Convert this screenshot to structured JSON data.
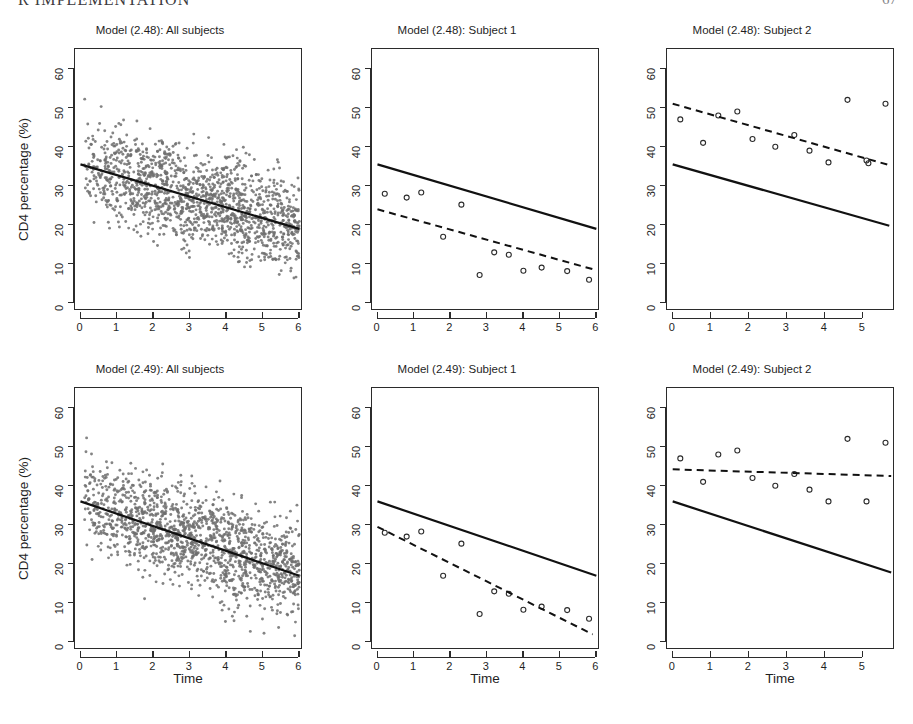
{
  "header": {
    "running_title": "R IMPLEMENTATION",
    "page_number": "67"
  },
  "figure": {
    "axis": {
      "xlabel": "Time",
      "ylabel": "CD4 percentage (%)",
      "yticks": [
        0,
        10,
        20,
        30,
        40,
        50,
        60
      ],
      "xticks_full": [
        0,
        1,
        2,
        3,
        4,
        5,
        6
      ],
      "xticks_short": [
        0,
        1,
        2,
        3,
        4,
        5
      ]
    },
    "panels": [
      {
        "id": "p248-all",
        "title": "Model (2.48): All subjects",
        "row": 0,
        "col": 0,
        "show_ylab": true,
        "show_xlab": false
      },
      {
        "id": "p248-s1",
        "title": "Model (2.48): Subject 1",
        "row": 0,
        "col": 1,
        "show_ylab": false,
        "show_xlab": false
      },
      {
        "id": "p248-s2",
        "title": "Model (2.48): Subject 2",
        "row": 0,
        "col": 2,
        "show_ylab": false,
        "show_xlab": false
      },
      {
        "id": "p249-all",
        "title": "Model (2.49): All subjects",
        "row": 1,
        "col": 0,
        "show_ylab": true,
        "show_xlab": true
      },
      {
        "id": "p249-s1",
        "title": "Model (2.49): Subject 1",
        "row": 1,
        "col": 1,
        "show_ylab": false,
        "show_xlab": true
      },
      {
        "id": "p249-s2",
        "title": "Model (2.49): Subject 2",
        "row": 1,
        "col": 2,
        "show_ylab": false,
        "show_xlab": true
      }
    ]
  },
  "colors": {
    "scatter_point": "#6e6e6e",
    "line": "#111111",
    "axis": "#2b2b2b",
    "background": "#ffffff"
  },
  "chart_data": [
    {
      "id": "p248-all",
      "type": "scatter",
      "title": "Model (2.48): All subjects",
      "xlabel": "Time",
      "ylabel": "CD4 percentage (%)",
      "xlim": [
        -0.15,
        6.1
      ],
      "ylim": [
        -2.0,
        65.0
      ],
      "xticks": [
        0,
        1,
        2,
        3,
        4,
        5,
        6
      ],
      "yticks": [
        0,
        10,
        20,
        30,
        40,
        50,
        60
      ],
      "grid": false,
      "legend": null,
      "series": [
        {
          "name": "CD4 observations (all subjects)",
          "style": "points",
          "marker": "filled-small-circle",
          "color": "#6e6e6e",
          "n_points": 1600,
          "note": "Dense cloud of all repeated CD4 percentage measurements; generated from the described density envelope."
        },
        {
          "name": "Population-average fit",
          "style": "solid-line",
          "color": "#111111",
          "intercept": 35.5,
          "slope": -2.75,
          "x_range": [
            0,
            6
          ],
          "y_endpoints": [
            35.5,
            19.0
          ]
        }
      ]
    },
    {
      "id": "p248-s1",
      "type": "scatter",
      "title": "Model (2.48): Subject 1",
      "xlabel": "Time",
      "ylabel": "CD4 percentage (%)",
      "xlim": [
        -0.15,
        6.1
      ],
      "ylim": [
        -2.0,
        65.0
      ],
      "xticks": [
        0,
        1,
        2,
        3,
        4,
        5,
        6
      ],
      "yticks": [
        0,
        10,
        20,
        30,
        40,
        50,
        60
      ],
      "grid": false,
      "legend": null,
      "series": [
        {
          "name": "Subject 1 observations",
          "style": "points",
          "marker": "open-circle",
          "color": "#2b2b2b",
          "x": [
            0.2,
            0.8,
            1.2,
            2.3,
            1.8,
            2.8,
            3.2,
            3.6,
            4.0,
            4.5,
            5.2,
            5.8
          ],
          "y": [
            28.0,
            27.0,
            28.3,
            25.2,
            17.0,
            7.2,
            13.0,
            12.4,
            8.3,
            9.1,
            8.2,
            6.0
          ]
        },
        {
          "name": "Population-average fit",
          "style": "solid-line",
          "color": "#111111",
          "intercept": 35.5,
          "slope": -2.75,
          "x_range": [
            0,
            6
          ],
          "y_endpoints": [
            35.5,
            19.0
          ]
        },
        {
          "name": "Subject-specific fit",
          "style": "dashed-line",
          "color": "#111111",
          "intercept": 24.0,
          "slope": -2.6,
          "x_range": [
            0,
            5.9
          ],
          "y_endpoints": [
            24.0,
            8.7
          ]
        }
      ]
    },
    {
      "id": "p248-s2",
      "type": "scatter",
      "title": "Model (2.48): Subject 2",
      "xlabel": "Time",
      "ylabel": "CD4 percentage (%)",
      "xlim": [
        -0.15,
        5.85
      ],
      "ylim": [
        -2.0,
        65.0
      ],
      "xticks": [
        0,
        1,
        2,
        3,
        4,
        5
      ],
      "yticks": [
        0,
        10,
        20,
        30,
        40,
        50,
        60
      ],
      "grid": false,
      "legend": null,
      "series": [
        {
          "name": "Subject 2 observations",
          "style": "points",
          "marker": "open-circle",
          "color": "#2b2b2b",
          "x": [
            0.2,
            0.8,
            1.2,
            1.7,
            2.1,
            2.7,
            3.2,
            3.6,
            4.1,
            4.6,
            5.1,
            5.15,
            5.6
          ],
          "y": [
            47.0,
            41.0,
            48.0,
            49.0,
            42.0,
            40.0,
            43.0,
            39.0,
            36.0,
            52.0,
            36.5,
            35.8,
            51.0
          ]
        },
        {
          "name": "Population-average fit",
          "style": "solid-line",
          "color": "#111111",
          "intercept": 35.5,
          "slope": -2.75,
          "x_range": [
            0,
            5.7
          ],
          "y_endpoints": [
            35.5,
            19.8
          ]
        },
        {
          "name": "Subject-specific fit",
          "style": "dashed-line",
          "color": "#111111",
          "intercept": 51.0,
          "slope": -2.75,
          "x_range": [
            0,
            5.7
          ],
          "y_endpoints": [
            51.0,
            35.3
          ]
        }
      ]
    },
    {
      "id": "p249-all",
      "type": "scatter",
      "title": "Model (2.49): All subjects",
      "xlabel": "Time",
      "ylabel": "CD4 percentage (%)",
      "xlim": [
        -0.15,
        6.1
      ],
      "ylim": [
        -2.0,
        65.0
      ],
      "xticks": [
        0,
        1,
        2,
        3,
        4,
        5,
        6
      ],
      "yticks": [
        0,
        10,
        20,
        30,
        40,
        50,
        60
      ],
      "grid": false,
      "legend": null,
      "series": [
        {
          "name": "CD4 observations (all subjects)",
          "style": "points",
          "marker": "filled-small-circle",
          "color": "#6e6e6e",
          "n_points": 1600,
          "note": "Same dense CD4 cloud as the Model (2.48) all-subjects panel."
        },
        {
          "name": "Population-average fit",
          "style": "solid-line",
          "color": "#111111",
          "intercept": 36.0,
          "slope": -3.17,
          "x_range": [
            0,
            6
          ],
          "y_endpoints": [
            36.0,
            17.0
          ]
        }
      ]
    },
    {
      "id": "p249-s1",
      "type": "scatter",
      "title": "Model (2.49): Subject 1",
      "xlabel": "Time",
      "ylabel": "CD4 percentage (%)",
      "xlim": [
        -0.15,
        6.1
      ],
      "ylim": [
        -2.0,
        65.0
      ],
      "xticks": [
        0,
        1,
        2,
        3,
        4,
        5,
        6
      ],
      "yticks": [
        0,
        10,
        20,
        30,
        40,
        50,
        60
      ],
      "grid": false,
      "legend": null,
      "series": [
        {
          "name": "Subject 1 observations",
          "style": "points",
          "marker": "open-circle",
          "color": "#2b2b2b",
          "x": [
            0.2,
            0.8,
            1.2,
            2.3,
            1.8,
            2.8,
            3.2,
            3.6,
            4.0,
            4.5,
            5.2,
            5.8
          ],
          "y": [
            28.0,
            27.0,
            28.3,
            25.2,
            17.0,
            7.2,
            13.0,
            12.4,
            8.3,
            9.1,
            8.2,
            6.0
          ]
        },
        {
          "name": "Population-average fit",
          "style": "solid-line",
          "color": "#111111",
          "intercept": 36.0,
          "slope": -3.17,
          "x_range": [
            0,
            6
          ],
          "y_endpoints": [
            36.0,
            17.0
          ]
        },
        {
          "name": "Subject-specific fit",
          "style": "dashed-line",
          "color": "#111111",
          "intercept": 29.5,
          "slope": -4.66,
          "x_range": [
            0,
            5.9
          ],
          "y_endpoints": [
            29.5,
            2.0
          ]
        }
      ]
    },
    {
      "id": "p249-s2",
      "type": "scatter",
      "title": "Model (2.49): Subject 2",
      "xlabel": "Time",
      "ylabel": "CD4 percentage (%)",
      "xlim": [
        -0.15,
        5.85
      ],
      "ylim": [
        -2.0,
        65.0
      ],
      "xticks": [
        0,
        1,
        2,
        3,
        4,
        5
      ],
      "yticks": [
        0,
        10,
        20,
        30,
        40,
        50,
        60
      ],
      "grid": false,
      "legend": null,
      "series": [
        {
          "name": "Subject 2 observations",
          "style": "points",
          "marker": "open-circle",
          "color": "#2b2b2b",
          "x": [
            0.2,
            0.8,
            1.2,
            1.7,
            2.1,
            2.7,
            3.2,
            3.6,
            4.1,
            4.6,
            5.1,
            5.6
          ],
          "y": [
            47.0,
            41.0,
            48.0,
            49.0,
            42.0,
            40.0,
            43.0,
            39.0,
            36.0,
            52.0,
            36.0,
            51.0
          ]
        },
        {
          "name": "Population-average fit",
          "style": "solid-line",
          "color": "#111111",
          "intercept": 36.0,
          "slope": -3.17,
          "x_range": [
            0,
            5.75
          ],
          "y_endpoints": [
            36.0,
            17.8
          ]
        },
        {
          "name": "Subject-specific fit",
          "style": "dashed-line",
          "color": "#111111",
          "intercept": 44.2,
          "slope": -0.3,
          "x_range": [
            0,
            5.75
          ],
          "y_endpoints": [
            44.2,
            42.5
          ]
        }
      ]
    }
  ]
}
